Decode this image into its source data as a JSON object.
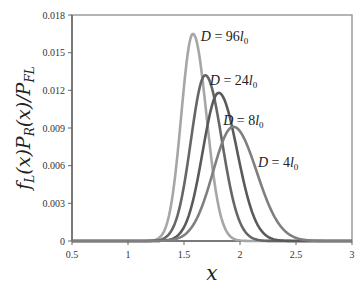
{
  "chart_data": {
    "type": "line",
    "title": "",
    "xlabel": "x",
    "ylabel": "f_L(x) P_R(x) / P_FL",
    "xlim": [
      0.5,
      3
    ],
    "ylim": [
      0,
      0.018
    ],
    "x_ticks": [
      "0.5",
      "1",
      "1.5",
      "2",
      "2.5",
      "3"
    ],
    "y_ticks": [
      "0",
      "0.003",
      "0.006",
      "0.009",
      "0.012",
      "0.015",
      "0.018"
    ],
    "grid": false,
    "legend": "inline annotations",
    "series": [
      {
        "name": "D = 96l0",
        "label_main": "D = 96",
        "label_sub": "0",
        "peak_x": 1.58,
        "peak_y": 0.0165,
        "sigma": 0.11,
        "color": "#a6a6a6"
      },
      {
        "name": "D = 24l0",
        "label_main": "D = 24",
        "label_sub": "0",
        "peak_x": 1.69,
        "peak_y": 0.0132,
        "sigma": 0.135,
        "color": "#666666"
      },
      {
        "name": "D = 8l0",
        "label_main": "D = 8",
        "label_sub": "0",
        "peak_x": 1.81,
        "peak_y": 0.0118,
        "sigma": 0.15,
        "color": "#5a5a5a"
      },
      {
        "name": "D = 4l0",
        "label_main": "D = 4",
        "label_sub": "0",
        "peak_x": 1.94,
        "peak_y": 0.0091,
        "sigma": 0.19,
        "color": "#7f7f7f"
      }
    ],
    "annotations": [
      {
        "text": "D = 96l0",
        "x": 1.65,
        "y": 0.0163
      },
      {
        "text": "D = 24l0",
        "x": 1.73,
        "y": 0.0128
      },
      {
        "text": "D = 8l0",
        "x": 1.85,
        "y": 0.0096
      },
      {
        "text": "D = 4l0",
        "x": 2.16,
        "y": 0.0063
      }
    ]
  },
  "axes": {
    "x_label": "x",
    "y_label_parts": [
      "f",
      "L",
      "(x)P",
      "R",
      "(x)/P",
      "FL"
    ]
  }
}
